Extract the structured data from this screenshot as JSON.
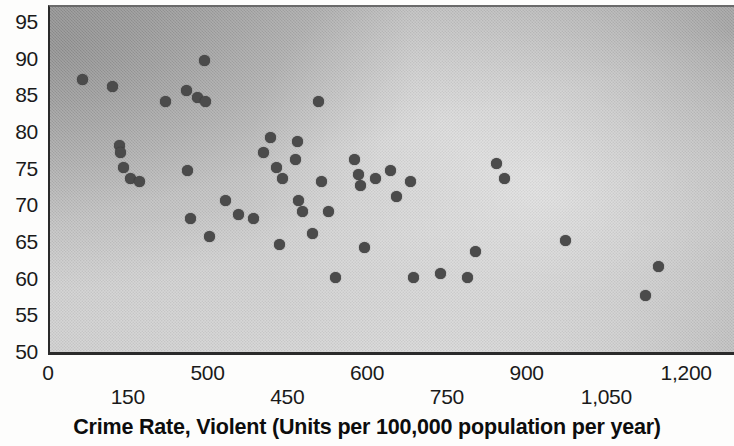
{
  "chart_data": {
    "type": "scatter",
    "title": "",
    "xlabel": "Crime Rate, Violent (Units per 100,000 population per year)",
    "ylabel": "",
    "xlim": [
      0,
      1290
    ],
    "ylim": [
      50,
      95
    ],
    "grid": false,
    "legend": null,
    "marker_color": "#4b4b4b",
    "panel_background": "gray gradient",
    "x_tick_labels": [
      {
        "label": "0",
        "value": 0,
        "row": "top"
      },
      {
        "label": "150",
        "value": 150,
        "row": "bottom"
      },
      {
        "label": "500",
        "value": 300,
        "row": "top"
      },
      {
        "label": "450",
        "value": 450,
        "row": "bottom"
      },
      {
        "label": "600",
        "value": 600,
        "row": "top"
      },
      {
        "label": "750",
        "value": 750,
        "row": "bottom"
      },
      {
        "label": "900",
        "value": 900,
        "row": "top"
      },
      {
        "label": "1,050",
        "value": 1050,
        "row": "bottom"
      },
      {
        "label": "1,200",
        "value": 1200,
        "row": "top"
      }
    ],
    "y_tick_labels": [
      "95",
      "90",
      "85",
      "80",
      "75",
      "70",
      "65",
      "60",
      "55",
      "50"
    ],
    "y_tick_values": [
      95,
      90,
      85,
      80,
      75,
      70,
      65,
      60,
      55,
      50
    ],
    "points": [
      {
        "x": 62,
        "y": 87.5
      },
      {
        "x": 117,
        "y": 86.5
      },
      {
        "x": 130,
        "y": 78.5
      },
      {
        "x": 133,
        "y": 77.5
      },
      {
        "x": 138,
        "y": 75.5
      },
      {
        "x": 152,
        "y": 74.0
      },
      {
        "x": 168,
        "y": 73.5
      },
      {
        "x": 218,
        "y": 84.5
      },
      {
        "x": 258,
        "y": 75.0
      },
      {
        "x": 265,
        "y": 68.5
      },
      {
        "x": 290,
        "y": 90.0
      },
      {
        "x": 256,
        "y": 86.0
      },
      {
        "x": 278,
        "y": 85.0
      },
      {
        "x": 293,
        "y": 84.5
      },
      {
        "x": 300,
        "y": 66.0
      },
      {
        "x": 330,
        "y": 71.0
      },
      {
        "x": 355,
        "y": 69.0
      },
      {
        "x": 383,
        "y": 68.5
      },
      {
        "x": 402,
        "y": 77.5
      },
      {
        "x": 414,
        "y": 79.5
      },
      {
        "x": 425,
        "y": 75.5
      },
      {
        "x": 437,
        "y": 74.0
      },
      {
        "x": 432,
        "y": 65.0
      },
      {
        "x": 466,
        "y": 79.0
      },
      {
        "x": 462,
        "y": 76.5
      },
      {
        "x": 468,
        "y": 71.0
      },
      {
        "x": 475,
        "y": 69.5
      },
      {
        "x": 494,
        "y": 66.5
      },
      {
        "x": 505,
        "y": 84.5
      },
      {
        "x": 510,
        "y": 73.5
      },
      {
        "x": 524,
        "y": 69.5
      },
      {
        "x": 536,
        "y": 60.5
      },
      {
        "x": 573,
        "y": 76.5
      },
      {
        "x": 580,
        "y": 74.5
      },
      {
        "x": 584,
        "y": 73.0
      },
      {
        "x": 592,
        "y": 64.5
      },
      {
        "x": 612,
        "y": 74.0
      },
      {
        "x": 640,
        "y": 75.0
      },
      {
        "x": 651,
        "y": 71.5
      },
      {
        "x": 678,
        "y": 73.5
      },
      {
        "x": 684,
        "y": 60.5
      },
      {
        "x": 735,
        "y": 61.0
      },
      {
        "x": 785,
        "y": 60.5
      },
      {
        "x": 800,
        "y": 64.0
      },
      {
        "x": 840,
        "y": 76.0
      },
      {
        "x": 855,
        "y": 74.0
      },
      {
        "x": 970,
        "y": 65.5
      },
      {
        "x": 1120,
        "y": 58.0
      },
      {
        "x": 1145,
        "y": 62.0
      }
    ]
  },
  "axis": {
    "x_title": "Crime Rate, Violent (Units per 100,000 population per year)"
  }
}
